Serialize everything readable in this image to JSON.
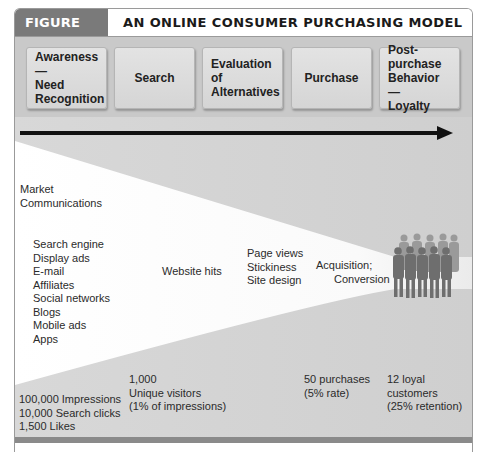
{
  "header": {
    "figure_label": "FIGURE 6.11",
    "title": "AN ONLINE CONSUMER PURCHASING MODEL"
  },
  "stages": [
    {
      "label": "Awareness —\nNeed\nRecognition"
    },
    {
      "label": "Search"
    },
    {
      "label": "Evaluation\nof\nAlternatives"
    },
    {
      "label": "Purchase"
    },
    {
      "label": "Post-purchase\nBehavior —\nLoyalty"
    }
  ],
  "funnel": {
    "market_communications": "Market\nCommunications",
    "channels": "Search engine\nDisplay ads\nE-mail\nAffiliates\nSocial networks\nBlogs\nMobile ads\nApps",
    "website_hits": "Website hits",
    "site_factors": "Page views\nStickiness\nSite design",
    "acquisition_line1": "Acquisition;",
    "acquisition_line2": "Conversion",
    "customers_icon": "group-of-people-icon"
  },
  "metrics": {
    "impressions": "100,000 Impressions\n10,000 Search clicks\n1,500 Likes",
    "visitors": "1,000\nUnique visitors\n(1% of impressions)",
    "purchases": "50 purchases\n(5% rate)",
    "loyal": "12 loyal\ncustomers\n(25% retention)"
  },
  "colors": {
    "figure_label_bg": "#7a7a7a",
    "band_bg": "#c9c9c9",
    "funnel_fill": "#ffffff",
    "arrow": "#111111"
  }
}
